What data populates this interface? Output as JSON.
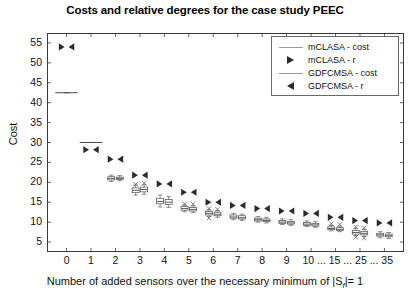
{
  "chart_data": {
    "type": "box",
    "title": "Costs and relative degrees for the case study PEEC",
    "xlabel": "Number of added sensors over the necessary minimum of |S_f|= 1",
    "xlabel_pre": "Number of added sensors over the necessary minimum of |S",
    "xlabel_sub": "f",
    "xlabel_post": "|= 1",
    "ylabel": "Cost",
    "ylim": [
      2.5,
      57.5
    ],
    "yticks": [
      5,
      10,
      15,
      20,
      25,
      30,
      35,
      40,
      45,
      50,
      55
    ],
    "xticks": [
      "0",
      "1",
      "2",
      "3",
      "4",
      "5",
      "6",
      "7",
      "8",
      "9",
      "10 ... 15 ... 25 ... 35"
    ],
    "xtick_positions": [
      0,
      1,
      2,
      3,
      4,
      5,
      6,
      7,
      8,
      9,
      10,
      11,
      12,
      13
    ],
    "xtick_extra_labels": [
      "10",
      "15",
      "25",
      "35"
    ],
    "grid": false,
    "legend_position": "top-right",
    "legend": [
      {
        "label": "mCLASA - cost",
        "symbol": "line"
      },
      {
        "label": "mCLASA - r",
        "symbol": "triangle-right"
      },
      {
        "label": "GDFCMSA - cost",
        "symbol": "line"
      },
      {
        "label": "GDFCMSA - r",
        "symbol": "triangle-left"
      }
    ],
    "series": [
      {
        "name": "mCLASA - cost",
        "kind": "box",
        "points": [
          {
            "x": 0,
            "median": 42.5,
            "q1": 42.5,
            "q3": 42.5,
            "lo": 42.5,
            "hi": 42.5,
            "outliers": []
          },
          {
            "x": 1,
            "median": 30.0,
            "q1": 30.0,
            "q3": 30.0,
            "lo": 30.0,
            "hi": 30.0,
            "outliers": []
          },
          {
            "x": 2,
            "median": 21.0,
            "q1": 20.6,
            "q3": 21.4,
            "lo": 20.2,
            "hi": 21.8,
            "outliers": []
          },
          {
            "x": 3,
            "median": 18.0,
            "q1": 17.4,
            "q3": 18.6,
            "lo": 16.8,
            "hi": 19.3,
            "outliers": [
              19.5
            ]
          },
          {
            "x": 4,
            "median": 15.2,
            "q1": 14.6,
            "q3": 16.0,
            "lo": 13.8,
            "hi": 16.8,
            "outliers": []
          },
          {
            "x": 5,
            "median": 13.4,
            "q1": 13.0,
            "q3": 13.9,
            "lo": 12.6,
            "hi": 14.3,
            "outliers": [
              14.6
            ]
          },
          {
            "x": 6,
            "median": 12.2,
            "q1": 11.8,
            "q3": 12.7,
            "lo": 11.4,
            "hi": 13.1,
            "outliers": [
              13.4,
              11.0
            ]
          },
          {
            "x": 7,
            "median": 11.3,
            "q1": 11.0,
            "q3": 11.8,
            "lo": 10.6,
            "hi": 12.2,
            "outliers": []
          },
          {
            "x": 8,
            "median": 10.6,
            "q1": 10.3,
            "q3": 11.0,
            "lo": 10.0,
            "hi": 11.4,
            "outliers": []
          },
          {
            "x": 9,
            "median": 10.0,
            "q1": 9.7,
            "q3": 10.4,
            "lo": 9.4,
            "hi": 10.8,
            "outliers": []
          },
          {
            "x": 10,
            "median": 9.5,
            "q1": 9.2,
            "q3": 9.9,
            "lo": 8.9,
            "hi": 10.3,
            "outliers": []
          },
          {
            "x": 11,
            "median": 8.4,
            "q1": 8.1,
            "q3": 8.8,
            "lo": 7.8,
            "hi": 9.2,
            "outliers": [
              9.6
            ]
          },
          {
            "x": 12,
            "median": 7.4,
            "q1": 7.0,
            "q3": 7.9,
            "lo": 6.6,
            "hi": 8.4,
            "outliers": [
              8.8,
              6.2
            ]
          },
          {
            "x": 13,
            "median": 6.8,
            "q1": 6.5,
            "q3": 7.2,
            "lo": 6.1,
            "hi": 7.6,
            "outliers": []
          }
        ]
      },
      {
        "name": "GDFCMSA - cost",
        "kind": "box",
        "points": [
          {
            "x": 0,
            "median": 42.5,
            "q1": 42.5,
            "q3": 42.5,
            "lo": 42.5,
            "hi": 42.5,
            "outliers": []
          },
          {
            "x": 1,
            "median": 30.0,
            "q1": 30.0,
            "q3": 30.0,
            "lo": 30.0,
            "hi": 30.0,
            "outliers": []
          },
          {
            "x": 2,
            "median": 21.0,
            "q1": 20.7,
            "q3": 21.3,
            "lo": 20.4,
            "hi": 21.7,
            "outliers": []
          },
          {
            "x": 3,
            "median": 18.2,
            "q1": 17.6,
            "q3": 18.8,
            "lo": 17.0,
            "hi": 19.4,
            "outliers": [
              19.8
            ]
          },
          {
            "x": 4,
            "median": 15.0,
            "q1": 14.4,
            "q3": 15.7,
            "lo": 13.7,
            "hi": 16.4,
            "outliers": []
          },
          {
            "x": 5,
            "median": 13.2,
            "q1": 12.8,
            "q3": 13.7,
            "lo": 12.4,
            "hi": 14.1,
            "outliers": [
              14.5
            ]
          },
          {
            "x": 6,
            "median": 12.0,
            "q1": 11.6,
            "q3": 12.5,
            "lo": 11.2,
            "hi": 12.9,
            "outliers": [
              13.2
            ]
          },
          {
            "x": 7,
            "median": 11.1,
            "q1": 10.8,
            "q3": 11.6,
            "lo": 10.4,
            "hi": 12.0,
            "outliers": []
          },
          {
            "x": 8,
            "median": 10.4,
            "q1": 10.1,
            "q3": 10.8,
            "lo": 9.8,
            "hi": 11.2,
            "outliers": []
          },
          {
            "x": 9,
            "median": 9.8,
            "q1": 9.5,
            "q3": 10.2,
            "lo": 9.2,
            "hi": 10.6,
            "outliers": []
          },
          {
            "x": 10,
            "median": 9.3,
            "q1": 9.0,
            "q3": 9.7,
            "lo": 8.7,
            "hi": 10.1,
            "outliers": []
          },
          {
            "x": 11,
            "median": 8.2,
            "q1": 7.9,
            "q3": 8.6,
            "lo": 7.6,
            "hi": 9.0,
            "outliers": [
              9.4
            ]
          },
          {
            "x": 12,
            "median": 7.2,
            "q1": 6.8,
            "q3": 7.7,
            "lo": 6.4,
            "hi": 8.2,
            "outliers": [
              8.6,
              6.0
            ]
          },
          {
            "x": 13,
            "median": 6.6,
            "q1": 6.3,
            "q3": 7.0,
            "lo": 5.9,
            "hi": 7.4,
            "outliers": []
          }
        ]
      },
      {
        "name": "mCLASA - r",
        "kind": "triangle-right",
        "points": [
          {
            "x": 0,
            "y": 54.0
          },
          {
            "x": 1,
            "y": 28.2
          },
          {
            "x": 2,
            "y": 25.8
          },
          {
            "x": 3,
            "y": 21.8
          },
          {
            "x": 4,
            "y": 19.6
          },
          {
            "x": 5,
            "y": 17.5
          },
          {
            "x": 6,
            "y": 15.0
          },
          {
            "x": 7,
            "y": 14.2
          },
          {
            "x": 8,
            "y": 13.4
          },
          {
            "x": 9,
            "y": 12.8
          },
          {
            "x": 10,
            "y": 12.2
          },
          {
            "x": 11,
            "y": 11.2
          },
          {
            "x": 12,
            "y": 10.4
          },
          {
            "x": 13,
            "y": 9.8
          }
        ]
      },
      {
        "name": "GDFCMSA - r",
        "kind": "triangle-left",
        "points": [
          {
            "x": 0,
            "y": 54.0
          },
          {
            "x": 1,
            "y": 28.2
          },
          {
            "x": 2,
            "y": 25.8
          },
          {
            "x": 3,
            "y": 21.8
          },
          {
            "x": 4,
            "y": 19.6
          },
          {
            "x": 5,
            "y": 17.5
          },
          {
            "x": 6,
            "y": 15.0
          },
          {
            "x": 7,
            "y": 14.2
          },
          {
            "x": 8,
            "y": 13.4
          },
          {
            "x": 9,
            "y": 12.8
          },
          {
            "x": 10,
            "y": 12.2
          },
          {
            "x": 11,
            "y": 11.2
          },
          {
            "x": 12,
            "y": 10.4
          },
          {
            "x": 13,
            "y": 9.8
          }
        ]
      }
    ]
  }
}
